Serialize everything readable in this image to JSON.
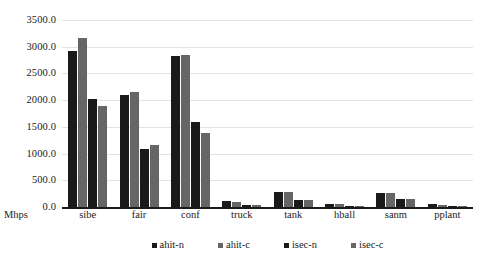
{
  "chart_data": {
    "type": "bar",
    "title": "",
    "subtitle": "",
    "xlabel": "",
    "ylabel": "Mhps",
    "ylim": [
      0,
      3500
    ],
    "ytick_labels": [
      "3500.0",
      "3000.0",
      "2500.0",
      "2000.0",
      "1500.0",
      "1000.0",
      "500.0",
      "0.0"
    ],
    "ytick_values": [
      3500,
      3000,
      2500,
      2000,
      1500,
      1000,
      500,
      0
    ],
    "grid": true,
    "legend_position": "bottom",
    "categories": [
      "sibe",
      "fair",
      "conf",
      "truck",
      "tank",
      "hball",
      "sanm",
      "pplant"
    ],
    "series": [
      {
        "name": "ahit-n",
        "color": "#1a1a1a",
        "values": [
          2920,
          2100,
          2820,
          105,
          280,
          60,
          260,
          48
        ]
      },
      {
        "name": "ahit-c",
        "color": "#666666",
        "values": [
          3170,
          2150,
          2850,
          95,
          290,
          52,
          255,
          38
        ]
      },
      {
        "name": "isec-n",
        "color": "#1a1a1a",
        "values": [
          2020,
          1090,
          1600,
          40,
          135,
          25,
          145,
          28
        ]
      },
      {
        "name": "isec-c",
        "color": "#666666",
        "values": [
          1890,
          1160,
          1380,
          38,
          135,
          25,
          150,
          25
        ]
      }
    ]
  },
  "colors": {
    "dark_bar": "#1a1a1a",
    "gray_bar": "#666666",
    "gridline": "#e2e2e2",
    "axis": "#1a1a1a",
    "background": "#ffffff"
  }
}
